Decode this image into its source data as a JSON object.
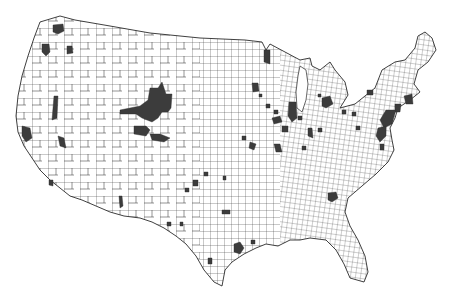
{
  "map": {
    "type": "choropleth",
    "region": "contiguous United States",
    "granularity": "county",
    "background_color": "#ffffff",
    "border_color": "#3a3a3a",
    "highlight_color": "#3c3c3c",
    "unhighlighted_color": "#ffffff",
    "title": null,
    "legend": null,
    "highlighted_regions": [
      {
        "area": "Puget Sound, WA",
        "x": 57,
        "y": 30
      },
      {
        "area": "Western WA",
        "x": 46,
        "y": 52
      },
      {
        "area": "Eastern WA",
        "x": 70,
        "y": 50
      },
      {
        "area": "Central CA/NV border",
        "x": 54,
        "y": 108
      },
      {
        "area": "San Francisco Bay, CA",
        "x": 27,
        "y": 134
      },
      {
        "area": "Central CA",
        "x": 61,
        "y": 143
      },
      {
        "area": "Southern CA",
        "x": 51,
        "y": 183
      },
      {
        "area": "Colorado/Wyoming cluster",
        "x": 150,
        "y": 110
      },
      {
        "area": "Southern AZ",
        "x": 121,
        "y": 200
      },
      {
        "area": "Minnesota NE",
        "x": 266,
        "y": 57
      },
      {
        "area": "Minneapolis, MN",
        "x": 255,
        "y": 88
      },
      {
        "area": "Chicago, IL",
        "x": 292,
        "y": 112
      },
      {
        "area": "Detroit, MI",
        "x": 327,
        "y": 104
      },
      {
        "area": "Indiana/Ohio",
        "x": 310,
        "y": 135
      },
      {
        "area": "St. Louis, MO",
        "x": 270,
        "y": 135
      },
      {
        "area": "Kansas City",
        "x": 234,
        "y": 141
      },
      {
        "area": "Oklahoma",
        "x": 225,
        "y": 180
      },
      {
        "area": "Dallas, TX",
        "x": 205,
        "y": 178
      },
      {
        "area": "Houston, TX",
        "x": 238,
        "y": 247
      },
      {
        "area": "Louisiana",
        "x": 253,
        "y": 244
      },
      {
        "area": "Atlanta, GA",
        "x": 333,
        "y": 198
      },
      {
        "area": "Northeast corridor",
        "x": 385,
        "y": 120
      },
      {
        "area": "Boston, MA",
        "x": 410,
        "y": 98
      },
      {
        "area": "New York/NJ",
        "x": 395,
        "y": 113
      },
      {
        "area": "Washington DC",
        "x": 382,
        "y": 140
      },
      {
        "area": "Upstate NY",
        "x": 371,
        "y": 93
      },
      {
        "area": "South Texas",
        "x": 210,
        "y": 262
      }
    ]
  }
}
